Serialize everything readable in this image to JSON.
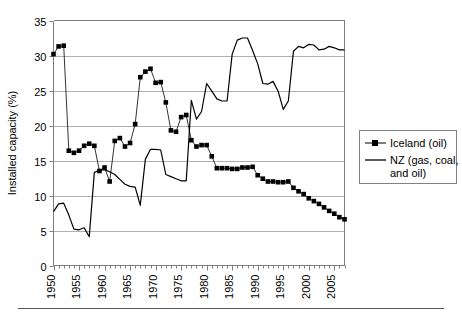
{
  "chart_data": {
    "type": "line",
    "title": "",
    "xlabel": "",
    "ylabel": "Installed capacity (%)",
    "xlim": [
      1950,
      2007
    ],
    "ylim": [
      0,
      35
    ],
    "grid": true,
    "legend_position": "right",
    "y_ticks": [
      "0",
      "5",
      "10",
      "15",
      "20",
      "25",
      "30",
      "35"
    ],
    "x_ticks": [
      "1950",
      "1955",
      "1960",
      "1965",
      "1970",
      "1975",
      "1980",
      "1985",
      "1990",
      "1995",
      "2000",
      "2005"
    ],
    "x": [
      1950,
      1951,
      1952,
      1953,
      1954,
      1955,
      1956,
      1957,
      1958,
      1959,
      1960,
      1961,
      1962,
      1963,
      1964,
      1965,
      1966,
      1967,
      1968,
      1969,
      1970,
      1971,
      1972,
      1973,
      1974,
      1975,
      1976,
      1977,
      1978,
      1979,
      1980,
      1981,
      1982,
      1983,
      1984,
      1985,
      1986,
      1987,
      1988,
      1989,
      1990,
      1991,
      1992,
      1993,
      1994,
      1995,
      1996,
      1997,
      1998,
      1999,
      2000,
      2001,
      2002,
      2003,
      2004,
      2005,
      2006,
      2007
    ],
    "series": [
      {
        "name": "Iceland (oil)",
        "marker": "square",
        "values": [
          30.2,
          31.3,
          31.4,
          16.4,
          16.1,
          16.4,
          17.1,
          17.4,
          17.1,
          13.5,
          14.0,
          12.0,
          17.8,
          18.2,
          17.0,
          17.5,
          20.2,
          26.9,
          27.7,
          28.1,
          26.1,
          26.2,
          23.3,
          19.3,
          19.1,
          21.2,
          21.5,
          17.9,
          17.0,
          17.2,
          17.2,
          15.6,
          13.9,
          13.9,
          13.9,
          13.8,
          13.8,
          14.0,
          14.0,
          14.1,
          12.9,
          12.4,
          12.0,
          12.0,
          11.9,
          11.9,
          12.0,
          11.1,
          10.6,
          10.2,
          9.6,
          9.2,
          8.8,
          8.3,
          7.8,
          7.4,
          6.9,
          6.6
        ]
      },
      {
        "name": "NZ (gas, coal, and oil)",
        "marker": "none",
        "values": [
          7.7,
          8.8,
          8.9,
          7.2,
          5.2,
          5.1,
          5.4,
          4.1,
          13.3,
          13.6,
          13.7,
          13.4,
          13.0,
          12.3,
          11.6,
          11.3,
          11.2,
          8.6,
          15.2,
          16.6,
          16.6,
          16.5,
          13.0,
          12.7,
          12.4,
          12.1,
          12.1,
          23.6,
          20.9,
          22.0,
          26.0,
          24.9,
          23.8,
          23.5,
          23.5,
          30.2,
          32.2,
          32.5,
          32.5,
          30.7,
          28.8,
          26.0,
          25.9,
          26.3,
          24.9,
          22.3,
          23.5,
          30.6,
          31.3,
          31.1,
          31.6,
          31.5,
          30.8,
          30.9,
          31.3,
          31.1,
          30.8,
          30.8
        ]
      }
    ]
  },
  "legend": {
    "items": [
      {
        "label": "Iceland (oil)",
        "style": "line-with-square-marker"
      },
      {
        "label": "NZ (gas, coal, and oil)",
        "style": "plain-line"
      }
    ]
  }
}
